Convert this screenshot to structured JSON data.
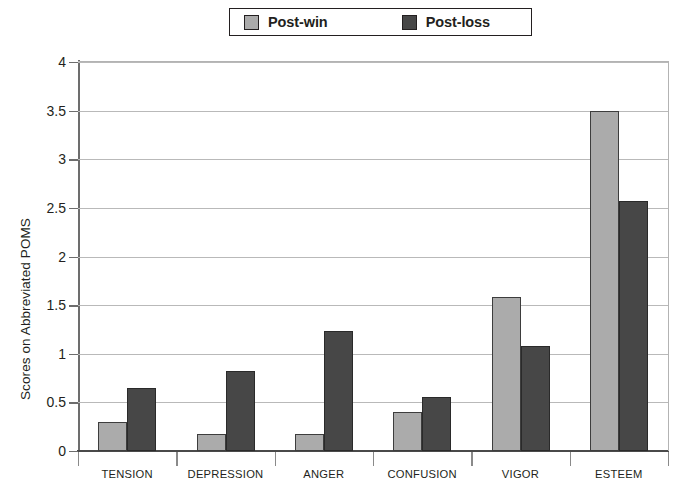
{
  "chart_data": {
    "type": "bar",
    "title": "",
    "xlabel": "",
    "ylabel": "Scores on Abbreviated POMS",
    "ylim": [
      0,
      4
    ],
    "ytick_step": 0.5,
    "yticks": [
      "4",
      "3.5",
      "3",
      "2.5",
      "2",
      "1.5",
      "1",
      "0.5",
      "0"
    ],
    "grid": true,
    "legend_position": "top",
    "categories": [
      "TENSION",
      "DEPRESSION",
      "ANGER",
      "CONFUSION",
      "VIGOR",
      "ESTEEM"
    ],
    "series": [
      {
        "name": "Post-win",
        "color": "#ababab",
        "values": [
          0.3,
          0.17,
          0.17,
          0.4,
          1.58,
          3.5
        ]
      },
      {
        "name": "Post-loss",
        "color": "#474747",
        "values": [
          0.65,
          0.82,
          1.23,
          0.56,
          1.08,
          2.57
        ]
      }
    ]
  },
  "legend": {
    "entries": [
      {
        "label": "Post-win",
        "swatch_color": "#ababab",
        "swatch_name": "post-win-swatch"
      },
      {
        "label": "Post-loss",
        "swatch_color": "#474747",
        "swatch_name": "post-loss-swatch"
      }
    ]
  },
  "axes": {
    "y_title": "Scores on Abbreviated POMS"
  }
}
